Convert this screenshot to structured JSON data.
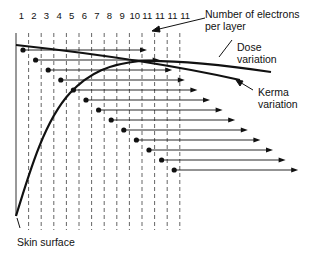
{
  "diagram": {
    "title_labels": {
      "electrons": [
        "Number of electrons",
        "per layer"
      ],
      "dose": [
        "Dose",
        "variation"
      ],
      "kerma": [
        "Kerma",
        "variation"
      ],
      "skin": "Skin surface"
    },
    "column_labels": [
      "1",
      "2",
      "3",
      "4",
      "5",
      "6",
      "7",
      "8",
      "9",
      "10",
      "11",
      "11",
      "11",
      "11"
    ],
    "layers": 13,
    "colors": {
      "line": "#111111",
      "grid": "#555555",
      "background": "#ffffff"
    }
  }
}
